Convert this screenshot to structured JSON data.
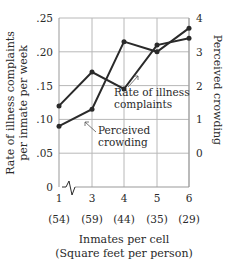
{
  "chart_data": {
    "type": "line",
    "title": "",
    "xlabel": "Inmates per cell",
    "xlabel_sub": "(Square feet per person)",
    "ylabel_left": "Rate of illness complaints per inmate per week",
    "ylabel_left_lines": [
      "Rate of illness complaints",
      "per inmate per week"
    ],
    "ylabel_right": "Perceived crowding",
    "x": [
      1,
      3,
      4,
      5,
      6
    ],
    "x_tick_labels": [
      "1",
      "3",
      "4",
      "5",
      "6"
    ],
    "x_sub_labels": [
      "(54)",
      "(59)",
      "(44)",
      "(35)",
      "(29)"
    ],
    "axis_break_marker": true,
    "ylim_left": [
      0,
      0.25
    ],
    "ylim_right": [
      -1,
      4
    ],
    "y_left_ticks": [
      "0",
      ".05",
      ".10",
      ".15",
      ".20",
      ".25"
    ],
    "y_left_tick_values": [
      0,
      0.05,
      0.1,
      0.15,
      0.2,
      0.25
    ],
    "y_right_ticks": [
      "0",
      "1",
      "2",
      "3",
      "4"
    ],
    "y_right_tick_values": [
      0,
      1,
      2,
      3,
      4
    ],
    "grid": true,
    "legend": "none (inline annotations with arrows)",
    "series": [
      {
        "name": "Rate of illness complaints",
        "axis": "left",
        "values": [
          0.12,
          0.17,
          0.145,
          0.21,
          0.22
        ]
      },
      {
        "name": "Perceived crowding",
        "axis": "right",
        "values": [
          0.8,
          1.3,
          3.3,
          3.0,
          3.7
        ]
      }
    ],
    "annotations": [
      {
        "text_lines": [
          "Rate of illness",
          "complaints"
        ],
        "points_to": "Rate of illness complaints"
      },
      {
        "text_lines": [
          "Perceived",
          "crowding"
        ],
        "points_to": "Perceived crowding"
      }
    ]
  },
  "colors": {
    "line": "#2a2a2a",
    "grid": "#b8b8b8",
    "text": "#2a2a2a",
    "background": "#ffffff"
  }
}
